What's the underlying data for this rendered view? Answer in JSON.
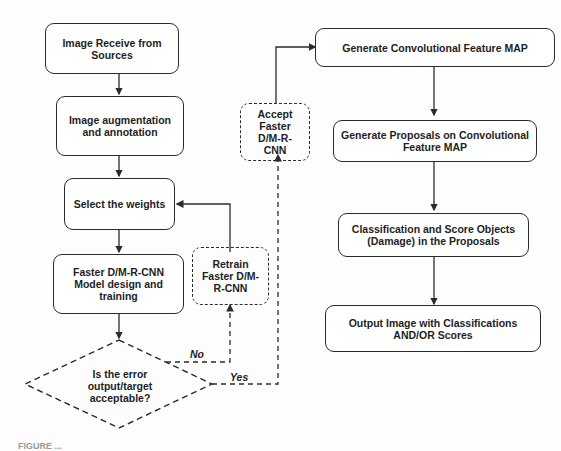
{
  "flowchart": {
    "nodes": {
      "receive": "Image Receive from Sources",
      "augment": "Image augmentation and annotation",
      "weights": "Select the weights",
      "design": "Faster D/M-R-CNN Model design and training",
      "retrain": "Retrain Faster D/M-R-CNN",
      "accept": "Accept Faster D/M-R-CNN",
      "decision": "Is the error output/target acceptable?",
      "feature_map": "Generate Convolutional Feature MAP",
      "proposals": "Generate Proposals on Convolutional Feature MAP",
      "classify": "Classification and Score Objects (Damage) in the Proposals",
      "output": "Output Image with Classifications AND/OR Scores"
    },
    "edge_labels": {
      "no": "No",
      "yes": "Yes"
    }
  },
  "caption": "FIGURE ..."
}
